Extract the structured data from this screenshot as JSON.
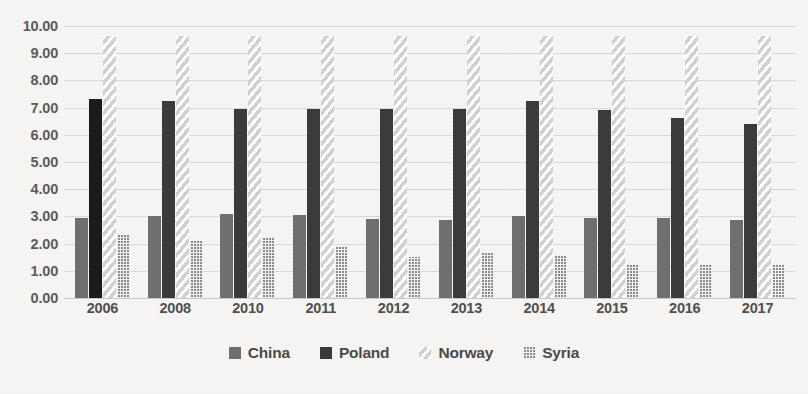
{
  "chart_data": {
    "type": "bar",
    "title": "",
    "subtitle": "",
    "xlabel": "",
    "ylabel": "",
    "ylim": [
      0,
      10
    ],
    "ytick_labels": [
      "10.00",
      "9.00",
      "8.00",
      "7.00",
      "6.00",
      "5.00",
      "4.00",
      "3.00",
      "2.00",
      "1.00",
      "0.00"
    ],
    "ytick_values": [
      10,
      9,
      8,
      7,
      6,
      5,
      4,
      3,
      2,
      1,
      0
    ],
    "grid": true,
    "legend_position": "bottom",
    "categories": [
      "2006",
      "2008",
      "2010",
      "2011",
      "2012",
      "2013",
      "2014",
      "2015",
      "2016",
      "2017"
    ],
    "series": [
      {
        "name": "China",
        "pattern": "solid-gray",
        "color": "#6f6f6f",
        "values": [
          2.95,
          3.0,
          3.1,
          3.05,
          2.9,
          2.85,
          3.0,
          2.95,
          2.95,
          2.85
        ]
      },
      {
        "name": "Poland",
        "pattern": "solid-dark",
        "color": "#3b3b3b",
        "values": [
          7.3,
          7.25,
          6.95,
          6.95,
          6.95,
          6.95,
          7.25,
          6.9,
          6.6,
          6.4
        ]
      },
      {
        "name": "Norway",
        "pattern": "diagonal-stripes",
        "color": "#d2d1cf",
        "values": [
          9.65,
          9.65,
          9.65,
          9.65,
          9.65,
          9.65,
          9.65,
          9.65,
          9.65,
          9.65
        ]
      },
      {
        "name": "Syria",
        "pattern": "checkered-gray",
        "color": "#8d8d8d",
        "values": [
          2.3,
          2.1,
          2.25,
          1.9,
          1.5,
          1.65,
          1.55,
          1.2,
          1.2,
          1.2
        ]
      }
    ]
  },
  "legend": {
    "items": [
      {
        "label": "China"
      },
      {
        "label": "Poland"
      },
      {
        "label": "Norway"
      },
      {
        "label": "Syria"
      }
    ]
  }
}
